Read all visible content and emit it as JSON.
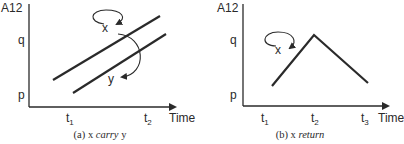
{
  "panels": [
    {
      "id": "a",
      "y_axis_label": "A12",
      "y_ticks": [
        "q",
        "p"
      ],
      "x_ticks": [
        {
          "base": "t",
          "sub": "1"
        },
        {
          "base": "t",
          "sub": "2"
        }
      ],
      "x_axis_label": "Time",
      "caption_prefix": "(a) x ",
      "caption_italic": "carry",
      "caption_suffix": " y",
      "loop_label_1": "x",
      "loop_label_2": "y"
    },
    {
      "id": "b",
      "y_axis_label": "A12",
      "y_ticks": [
        "q",
        "p"
      ],
      "x_ticks": [
        {
          "base": "t",
          "sub": "1"
        },
        {
          "base": "t",
          "sub": "2"
        },
        {
          "base": "t",
          "sub": "3"
        }
      ],
      "x_axis_label": "Time",
      "caption_prefix": "(b) x ",
      "caption_italic": "return",
      "caption_suffix": "",
      "loop_label_1": "x"
    }
  ],
  "colors": {
    "ink": "#2a2a2a",
    "background": "#ffffff"
  }
}
